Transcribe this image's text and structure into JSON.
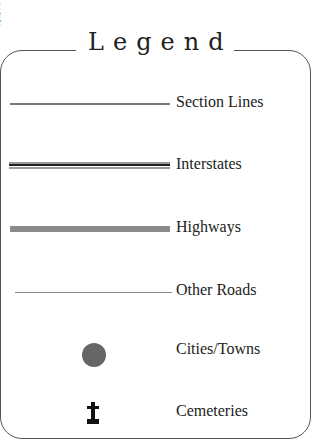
{
  "side_text": "points",
  "legend": {
    "title": "Legend",
    "items": [
      {
        "label": "Section Lines",
        "symbol": "thin-gray-line"
      },
      {
        "label": "Interstates",
        "symbol": "double-line"
      },
      {
        "label": "Highways",
        "symbol": "thick-gray-bar"
      },
      {
        "label": "Other Roads",
        "symbol": "hairline"
      },
      {
        "label": "Cities/Towns",
        "symbol": "filled-circle"
      },
      {
        "label": "Cemeteries",
        "symbol": "cross-marker"
      }
    ]
  },
  "colors": {
    "border": "#555555",
    "text": "#222222",
    "city_fill": "#666666",
    "highway_fill": "#8a8a8a"
  }
}
